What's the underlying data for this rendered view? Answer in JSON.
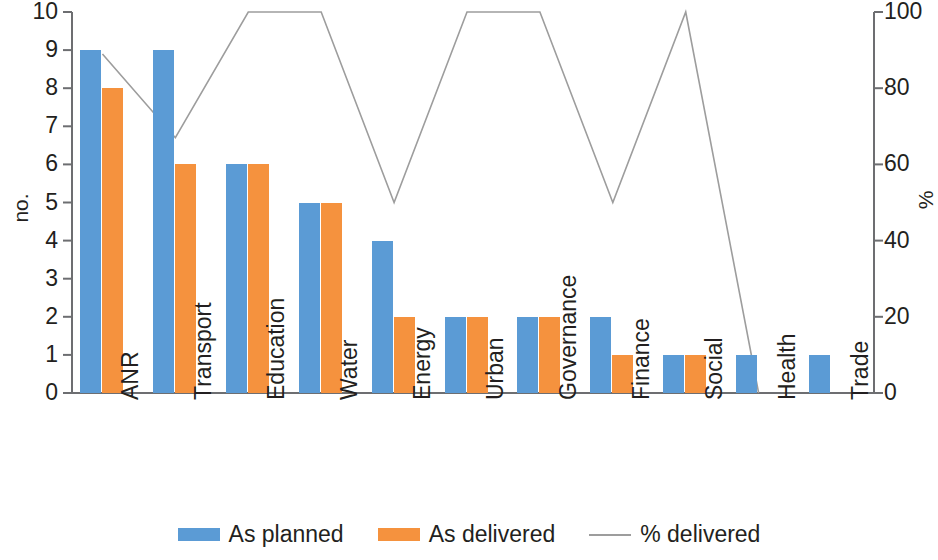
{
  "chart_data": {
    "type": "bar",
    "title": "",
    "subtitle": "",
    "xlabel": "",
    "ylabel": "no.",
    "y2label": "%",
    "ylim": [
      0,
      10
    ],
    "y2lim": [
      0,
      100
    ],
    "grid": false,
    "legend_position": "bottom",
    "categories": [
      "ANR",
      "Transport",
      "Education",
      "Water",
      "Energy",
      "Urban",
      "Governance",
      "Finance",
      "Social",
      "Health",
      "Trade"
    ],
    "y_ticks": [
      "0",
      "1",
      "2",
      "3",
      "4",
      "5",
      "6",
      "7",
      "8",
      "9",
      "10"
    ],
    "y2_ticks": [
      "0",
      "20",
      "40",
      "60",
      "80",
      "100"
    ],
    "series": [
      {
        "name": "As planned",
        "type": "bar",
        "axis": "left",
        "color": "#5b9bd5",
        "values": [
          9,
          9,
          6,
          5,
          4,
          2,
          2,
          2,
          1,
          1,
          1
        ]
      },
      {
        "name": "As delivered",
        "type": "bar",
        "axis": "left",
        "color": "#f5923e",
        "values": [
          8,
          6,
          6,
          5,
          2,
          2,
          2,
          1,
          1,
          0,
          0
        ]
      },
      {
        "name": "% delivered",
        "type": "line",
        "axis": "right",
        "color": "#9d9d9d",
        "values": [
          89,
          67,
          100,
          100,
          50,
          100,
          100,
          50,
          100,
          0,
          null
        ]
      }
    ]
  },
  "legend": {
    "items": [
      {
        "label": "As planned",
        "swatch": "bar",
        "color": "#5b9bd5"
      },
      {
        "label": "As delivered",
        "swatch": "bar",
        "color": "#f5923e"
      },
      {
        "label": "% delivered",
        "swatch": "line",
        "color": "#9d9d9d"
      }
    ]
  }
}
